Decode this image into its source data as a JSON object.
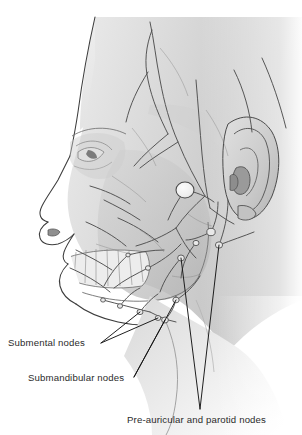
{
  "figure": {
    "view": "left lateral profile",
    "style": "greyscale medical illustration",
    "background_color": "#ffffff",
    "skin_tone_light": "#e4e4e4",
    "skin_tone_mid": "#c9c9c9",
    "skin_tone_dark": "#a8a8a8",
    "vessel_color": "#4a4a4a",
    "node_highlight_color": "#f4f4f4",
    "outline_color": "#3a3a3a",
    "leader_line_color": "#1a1a1a"
  },
  "labels": [
    {
      "id": "submental",
      "text": "Submental nodes",
      "x": 8,
      "y": 338,
      "leader_tip": {
        "x": 101,
        "y": 343
      },
      "targets": [
        {
          "x": 140,
          "y": 312
        },
        {
          "x": 158,
          "y": 318
        }
      ]
    },
    {
      "id": "submandibular",
      "text": "Submandibular nodes",
      "x": 28,
      "y": 373,
      "leader_tip": {
        "x": 134,
        "y": 377
      },
      "targets": [
        {
          "x": 165,
          "y": 320
        },
        {
          "x": 176,
          "y": 300
        }
      ]
    },
    {
      "id": "preauricular",
      "text": "Pre-auricular and parotid nodes",
      "x": 127,
      "y": 415,
      "leader_tip": {
        "x": 200,
        "y": 409
      },
      "targets": [
        {
          "x": 181,
          "y": 258
        },
        {
          "x": 219,
          "y": 245
        }
      ]
    }
  ],
  "anatomy": {
    "parts": [
      "scalp",
      "forehead",
      "brow",
      "eye",
      "nose",
      "nostril",
      "lips",
      "chin",
      "jaw",
      "teeth",
      "mandible",
      "ear",
      "neck"
    ],
    "highlighted_node": {
      "name": "parotid-node",
      "x": 185,
      "y": 190,
      "rx": 9,
      "ry": 9
    }
  },
  "nodes": [
    {
      "x": 185,
      "y": 190,
      "r": 9.0,
      "kind": "parotid-major"
    },
    {
      "x": 211,
      "y": 232,
      "r": 4.2,
      "kind": "parotid"
    },
    {
      "x": 219,
      "y": 245,
      "r": 3.6,
      "kind": "preauricular"
    },
    {
      "x": 196,
      "y": 243,
      "r": 3.0,
      "kind": "parotid"
    },
    {
      "x": 181,
      "y": 258,
      "r": 3.4,
      "kind": "parotid"
    },
    {
      "x": 176,
      "y": 300,
      "r": 3.2,
      "kind": "submandibular"
    },
    {
      "x": 165,
      "y": 320,
      "r": 3.4,
      "kind": "submandibular"
    },
    {
      "x": 158,
      "y": 318,
      "r": 2.8,
      "kind": "submental"
    },
    {
      "x": 140,
      "y": 312,
      "r": 3.0,
      "kind": "submental"
    },
    {
      "x": 120,
      "y": 306,
      "r": 2.6,
      "kind": "submental"
    },
    {
      "x": 103,
      "y": 300,
      "r": 2.4,
      "kind": "submental"
    },
    {
      "x": 148,
      "y": 268,
      "r": 2.6,
      "kind": "facial"
    },
    {
      "x": 128,
      "y": 255,
      "r": 2.2,
      "kind": "facial"
    }
  ]
}
